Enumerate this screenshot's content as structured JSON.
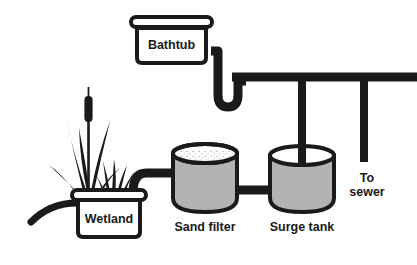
{
  "figure": {
    "background_color": "#ffffff",
    "stroke_color": "#1a1a1a",
    "tank_fill_color": "#b3b3b3",
    "white_fill_color": "#ffffff"
  },
  "components": {
    "bathtub": {
      "label": "Bathtub",
      "icon": "bathtub-icon",
      "shape": "rounded-rectangle-with-rim"
    },
    "wetland": {
      "label": "Wetland",
      "icon": "wetland-planter-icon",
      "shape": "rounded-rectangle-with-rim"
    },
    "sand_filter": {
      "label": "Sand filter",
      "icon": "cylinder-tank-icon",
      "shape": "open-top-cylinder",
      "contents": "sand"
    },
    "surge_tank": {
      "label": "Surge tank",
      "icon": "cylinder-tank-icon",
      "shape": "open-top-cylinder"
    },
    "sewer_outlet": {
      "label_line1": "To",
      "label_line2": "sewer",
      "icon": "downpipe-icon"
    },
    "plants": {
      "icon": "cattail-plant-icon",
      "secondary_icon": "grass-tuft-icon"
    }
  },
  "pipes": {
    "bathtub_to_main": "p-trap-pipe",
    "main_horizontal": "main-drain-pipe",
    "main_to_surge_tank": "surge-tank-downpipe",
    "main_to_sewer": "sewer-downpipe",
    "wetland_outlet": "wetland-outlet-pipe",
    "wetland_to_sand_filter": "wetland-to-sand-filter-pipe",
    "sand_filter_to_surge_tank": "sand-filter-to-surge-tank-pipe"
  }
}
